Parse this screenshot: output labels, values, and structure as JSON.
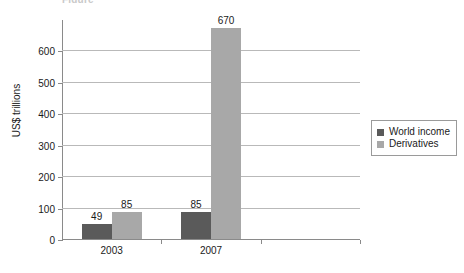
{
  "chart_data": {
    "type": "bar",
    "title": "",
    "xlabel": "",
    "ylabel": "US$ trillions",
    "ylim": [
      0,
      700
    ],
    "yticks": [
      0,
      100,
      200,
      300,
      400,
      500,
      600
    ],
    "grid": true,
    "legend_position": "right",
    "categories": [
      "2003",
      "2007",
      ""
    ],
    "series": [
      {
        "name": "World income",
        "color": "#5a5a5a",
        "values": [
          49,
          85,
          null
        ],
        "labels": [
          "49",
          "85",
          ""
        ]
      },
      {
        "name": "Derivatives",
        "color": "#a8a8a8",
        "values": [
          85,
          670,
          null
        ],
        "labels": [
          "85",
          "670",
          ""
        ]
      }
    ]
  },
  "axis": {
    "y_title": "US$ trillions",
    "y_tick_labels": [
      "600",
      "500",
      "400",
      "300",
      "200",
      "100",
      "0"
    ],
    "x_tick_labels": [
      "2003",
      "2007"
    ]
  },
  "legend": {
    "items": [
      {
        "label": "World income",
        "color": "#5a5a5a"
      },
      {
        "label": "Derivatives",
        "color": "#a8a8a8"
      }
    ]
  },
  "title_strip": {
    "text": "Figure"
  }
}
